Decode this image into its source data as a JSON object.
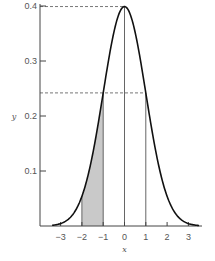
{
  "chart_data": {
    "type": "line",
    "title": "",
    "xlabel": "x",
    "ylabel": "y",
    "function": "standard normal density y = (1/sqrt(2*pi)) * exp(-x^2/2)",
    "xlim": [
      -3.8,
      3.7
    ],
    "ylim": [
      0,
      0.4
    ],
    "curve_x_range": [
      -3.4,
      3.5
    ],
    "x_ticks": [
      -3,
      -2,
      -1,
      0,
      1,
      2,
      3
    ],
    "x_tick_labels": [
      "−3",
      "−2",
      "−1",
      "0",
      "1",
      "2",
      "3"
    ],
    "y_ticks": [
      0.1,
      0.2,
      0.3,
      0.4
    ],
    "y_tick_labels": [
      "0.1",
      "0.2",
      "0.3",
      "0.4"
    ],
    "shaded_region": {
      "from": -2,
      "to": -1,
      "color": "#c9c9c9"
    },
    "vertical_lines": [
      -2,
      -1,
      0,
      1
    ],
    "horizontal_dashed_lines": [
      {
        "y": 0.399,
        "to_x": 0
      },
      {
        "y": 0.242,
        "to_x": 1
      }
    ],
    "grid": false,
    "legend": "none"
  }
}
